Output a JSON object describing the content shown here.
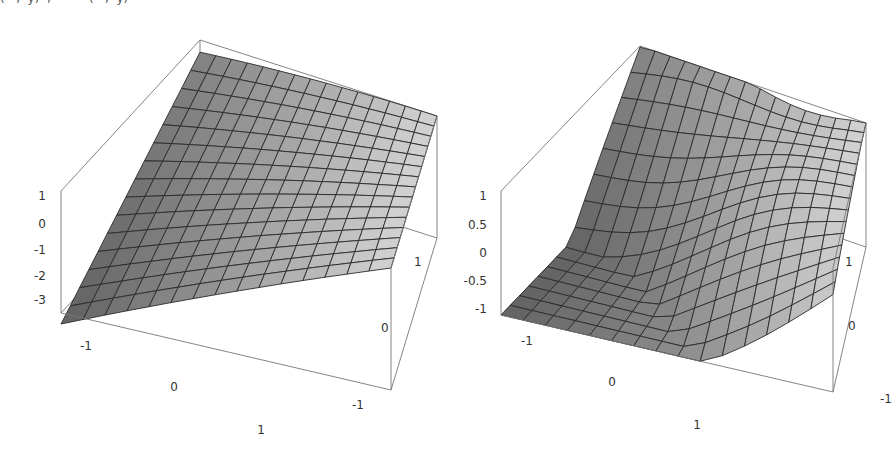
{
  "caption_fragment": "(   ,  y)  ,          (   ,  y)",
  "chart_data": [
    {
      "type": "surface3d",
      "title": "",
      "xlabel": "",
      "ylabel": "",
      "zlabel": "",
      "x_range": [
        -1.5,
        1.5
      ],
      "y_range": [
        -1.5,
        1.5
      ],
      "z_range": [
        -3.5,
        1
      ],
      "x_ticks": [
        "-1",
        "0",
        "1"
      ],
      "y_ticks": [
        "-1",
        "0",
        "1"
      ],
      "z_ticks": [
        "1",
        "0",
        "-1",
        "-2",
        "-3"
      ],
      "mesh": "15x15 grid, gray shaded, black mesh lines",
      "shape": "dome-like surface, max ~1 at back corner, min ~-3.4 at left-front corner",
      "grid": false,
      "box": true
    },
    {
      "type": "surface3d",
      "title": "",
      "xlabel": "",
      "ylabel": "",
      "zlabel": "",
      "x_range": [
        -1.5,
        1.5
      ],
      "y_range": [
        -1.5,
        1.5
      ],
      "z_range": [
        -1,
        1
      ],
      "x_ticks": [
        "-1",
        "0",
        "1"
      ],
      "y_ticks": [
        "-1",
        "0",
        "1"
      ],
      "z_ticks": [
        "1",
        "0.5",
        "0",
        "-0.5",
        "-1"
      ],
      "mesh": "15x15 grid, gray shaded, black mesh lines",
      "shape": "wavy saddle-like surface, peak ~1 at back corner, ~-1 at left-front corner",
      "grid": false,
      "box": true
    }
  ],
  "plots": [
    {
      "z_ticks": [
        {
          "label": "1",
          "x": 46,
          "y": 200
        },
        {
          "label": "0",
          "x": 46,
          "y": 228
        },
        {
          "label": "-1",
          "x": 46,
          "y": 254
        },
        {
          "label": "-2",
          "x": 46,
          "y": 280
        },
        {
          "label": "-3",
          "x": 46,
          "y": 304
        }
      ],
      "x_ticks": [
        {
          "label": "-1",
          "x": 86,
          "y": 350
        },
        {
          "label": "0",
          "x": 174,
          "y": 391
        },
        {
          "label": "1",
          "x": 261,
          "y": 434
        }
      ],
      "y_ticks": [
        {
          "label": "-1",
          "x": 352,
          "y": 409
        },
        {
          "label": "0",
          "x": 381,
          "y": 332
        },
        {
          "label": "1",
          "x": 414,
          "y": 266
        }
      ]
    },
    {
      "z_ticks": [
        {
          "label": "1",
          "x": 41,
          "y": 200
        },
        {
          "label": "0.5",
          "x": 41,
          "y": 229
        },
        {
          "label": "0",
          "x": 41,
          "y": 257
        },
        {
          "label": "-0.5",
          "x": 41,
          "y": 285
        },
        {
          "label": "-1",
          "x": 41,
          "y": 313
        }
      ],
      "x_ticks": [
        {
          "label": "-1",
          "x": 81,
          "y": 345
        },
        {
          "label": "0",
          "x": 166,
          "y": 386
        },
        {
          "label": "1",
          "x": 251,
          "y": 429
        }
      ],
      "y_ticks": [
        {
          "label": "-1",
          "x": 434,
          "y": 403
        },
        {
          "label": "0",
          "x": 402,
          "y": 330
        },
        {
          "label": "1",
          "x": 399,
          "y": 266
        }
      ]
    }
  ]
}
